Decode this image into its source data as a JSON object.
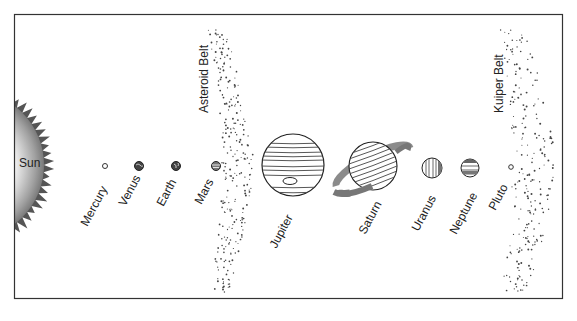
{
  "colors": {
    "frame": "#333333",
    "line": "#333333",
    "sun_dark": "#555555",
    "ring": "#888888",
    "background": "#ffffff"
  },
  "sun": {
    "label": "Sun"
  },
  "belts": {
    "asteroid": {
      "label": "Asteroid Belt"
    },
    "kuiper": {
      "label": "Kuiper Belt"
    }
  },
  "planets": [
    {
      "name": "Mercury"
    },
    {
      "name": "Venus"
    },
    {
      "name": "Earth"
    },
    {
      "name": "Mars"
    },
    {
      "name": "Jupiter"
    },
    {
      "name": "Saturn"
    },
    {
      "name": "Uranus"
    },
    {
      "name": "Neptune"
    },
    {
      "name": "Pluto"
    }
  ]
}
